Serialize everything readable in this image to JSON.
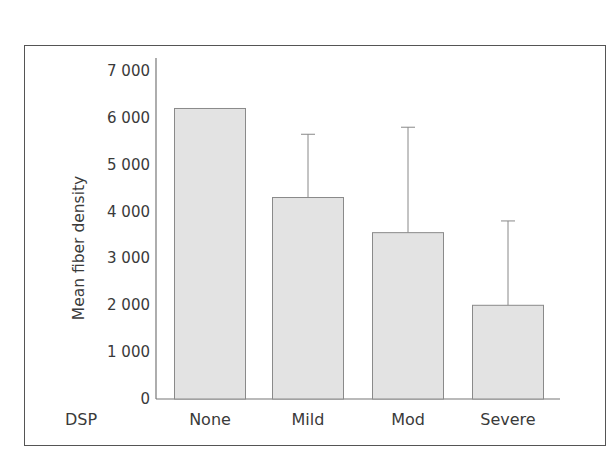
{
  "chart_data": {
    "type": "bar",
    "title": "",
    "xlabel": "DSP",
    "ylabel": "Mean fiber density",
    "categories": [
      "None",
      "Mild",
      "Mod",
      "Severe"
    ],
    "values": [
      6200,
      4300,
      3550,
      2000
    ],
    "error_upper": [
      null,
      5650,
      5800,
      3800
    ],
    "ylim": [
      0,
      7000
    ],
    "yticks": [
      0,
      1000,
      2000,
      3000,
      4000,
      5000,
      6000,
      7000
    ],
    "ytick_labels": [
      "0",
      "1 000",
      "2 000",
      "3 000",
      "4 000",
      "5 000",
      "6 000",
      "7 000"
    ],
    "grid": false,
    "legend": null,
    "bar_color": "#e3e3e3",
    "bar_edge_color": "#8a8a8a"
  },
  "labels": {
    "group_label": "DSP",
    "y_title": "Mean fiber density"
  }
}
